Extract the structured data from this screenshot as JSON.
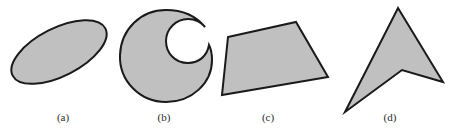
{
  "figure": {
    "width": 461,
    "height": 132,
    "background_color": "#ffffff",
    "shape_fill_color": "#c0c0c0",
    "shape_stroke_color": "#1a1a1a",
    "caption_color": "#2b2b2b",
    "stroke_width": 2
  },
  "panels": [
    {
      "id": "a",
      "caption": "(a)",
      "caption_x": 63,
      "caption_y": 111,
      "shape_name": "ellipse",
      "shape_type": "ellipse",
      "geometry": {
        "cx": 59,
        "cy": 52,
        "rx": 52,
        "ry": 24,
        "rotation_deg": -27
      }
    },
    {
      "id": "b",
      "caption": "(b)",
      "caption_x": 164,
      "caption_y": 111,
      "shape_name": "crescent",
      "shape_type": "path",
      "geometry": {
        "path": "M 166 10 C 141 10 121 29 120 55 C 119 81 140 102 166 102 C 192 102 212 83 212 60 C 212 54 211 49 209 45 C 207 56 199 63 188 63 C 175 63 166 53 166 41 C 166 29 176 19 188 19 C 195 19 201 22 205 27 C 196 16 182 10 166 10 Z"
      }
    },
    {
      "id": "c",
      "caption": "(c)",
      "caption_x": 268,
      "caption_y": 111,
      "shape_name": "quadrilateral",
      "shape_type": "polygon",
      "geometry": {
        "points": "228,37 296,22 328,77 222,95"
      }
    },
    {
      "id": "d",
      "caption": "(d)",
      "caption_x": 390,
      "caption_y": 111,
      "shape_name": "dart",
      "shape_type": "polygon",
      "geometry": {
        "points": "398,8 443,82 402,70 345,112"
      }
    }
  ]
}
